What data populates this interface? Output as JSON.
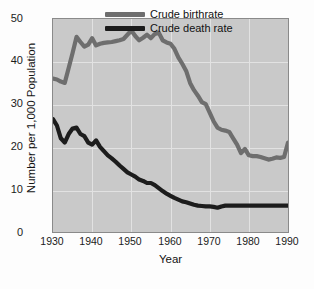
{
  "chart_data": {
    "type": "line",
    "title": "",
    "xlabel": "Year",
    "ylabel": "Number per 1,000 Population",
    "xlim": [
      1930,
      1990
    ],
    "ylim": [
      0,
      50
    ],
    "xticks": [
      "1930",
      "1940",
      "1950",
      "1960",
      "1970",
      "1980",
      "1990"
    ],
    "yticks": [
      "0",
      "10",
      "20",
      "30",
      "40",
      "50"
    ],
    "grid": true,
    "legend_position": "top-right-inside",
    "plot_background": "#c9c9c9",
    "series": [
      {
        "name": "Crude birthrate",
        "color": "#6e6e6e",
        "x": [
          1930,
          1931,
          1932,
          1933,
          1934,
          1935,
          1936,
          1937,
          1938,
          1939,
          1940,
          1941,
          1942,
          1943,
          1944,
          1945,
          1946,
          1947,
          1948,
          1949,
          1950,
          1951,
          1952,
          1953,
          1954,
          1955,
          1956,
          1957,
          1958,
          1959,
          1960,
          1961,
          1962,
          1963,
          1964,
          1965,
          1966,
          1967,
          1968,
          1969,
          1970,
          1971,
          1972,
          1973,
          1974,
          1975,
          1976,
          1977,
          1978,
          1979,
          1980,
          1981,
          1982,
          1983,
          1984,
          1985,
          1986,
          1987,
          1988,
          1989,
          1990
        ],
        "values": [
          36.0,
          35.8,
          35.3,
          35.0,
          38.5,
          42.0,
          45.8,
          44.6,
          43.5,
          44.0,
          45.5,
          43.8,
          44.2,
          44.4,
          44.5,
          44.6,
          44.8,
          45.0,
          45.3,
          46.3,
          47.3,
          46.0,
          45.0,
          45.6,
          46.3,
          45.5,
          46.5,
          46.8,
          45.0,
          44.5,
          44.2,
          43.0,
          41.0,
          39.5,
          37.8,
          35.0,
          33.3,
          32.0,
          30.5,
          30.0,
          28.0,
          26.0,
          24.5,
          24.0,
          23.8,
          23.5,
          22.0,
          20.5,
          18.5,
          19.5,
          18.0,
          17.8,
          17.8,
          17.6,
          17.3,
          17.0,
          17.2,
          17.5,
          17.4,
          17.6,
          21.0
        ]
      },
      {
        "name": "Crude death rate",
        "color": "#1c1c1c",
        "x": [
          1930,
          1931,
          1932,
          1933,
          1934,
          1935,
          1936,
          1937,
          1938,
          1939,
          1940,
          1941,
          1942,
          1943,
          1944,
          1945,
          1946,
          1947,
          1948,
          1949,
          1950,
          1951,
          1952,
          1953,
          1954,
          1955,
          1956,
          1957,
          1958,
          1959,
          1960,
          1961,
          1962,
          1963,
          1964,
          1965,
          1966,
          1967,
          1968,
          1969,
          1970,
          1971,
          1972,
          1973,
          1974,
          1975,
          1976,
          1977,
          1978,
          1979,
          1980,
          1981,
          1982,
          1983,
          1984,
          1985,
          1986,
          1987,
          1988,
          1989,
          1990
        ],
        "values": [
          26.5,
          25.0,
          22.0,
          21.0,
          23.0,
          24.3,
          24.5,
          23.0,
          22.5,
          21.0,
          20.5,
          21.5,
          20.0,
          19.0,
          18.0,
          17.3,
          16.5,
          15.6,
          14.8,
          14.0,
          13.5,
          13.0,
          12.3,
          12.0,
          11.5,
          11.5,
          11.0,
          10.3,
          9.6,
          9.0,
          8.5,
          8.0,
          7.6,
          7.2,
          7.0,
          6.7,
          6.4,
          6.2,
          6.1,
          6.0,
          6.0,
          5.9,
          5.7,
          6.0,
          6.2,
          6.2,
          6.2,
          6.2,
          6.2,
          6.2,
          6.2,
          6.2,
          6.2,
          6.2,
          6.2,
          6.2,
          6.2,
          6.2,
          6.2,
          6.2,
          6.2
        ]
      }
    ]
  },
  "legend": {
    "items": [
      {
        "label": "Crude birthrate",
        "color": "#6e6e6e"
      },
      {
        "label": "Crude death rate",
        "color": "#1c1c1c"
      }
    ]
  },
  "axes": {
    "x_title": "Year",
    "y_title": "Number per 1,000 Population",
    "x_tick_0": "1930",
    "x_tick_1": "1940",
    "x_tick_2": "1950",
    "x_tick_3": "1960",
    "x_tick_4": "1970",
    "x_tick_5": "1980",
    "x_tick_6": "1990",
    "y_tick_0": "0",
    "y_tick_1": "10",
    "y_tick_2": "20",
    "y_tick_3": "30",
    "y_tick_4": "40",
    "y_tick_5": "50"
  }
}
